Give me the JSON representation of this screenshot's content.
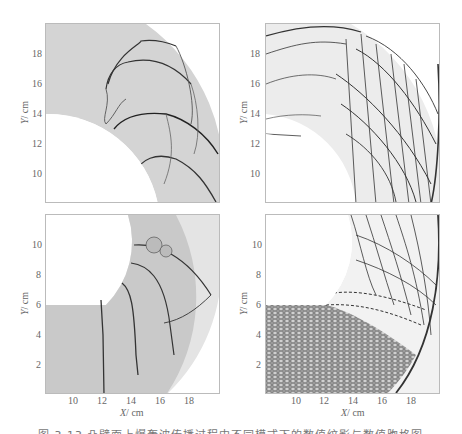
{
  "figure": {
    "caption_visible_fragment": "图 3.13  凸壁面上爆轰波传播过程中不同模式下的数值纹影与数值胞格图",
    "panels": [
      {
        "id": "top-left",
        "type": "numerical-schlieren",
        "yaxis": {
          "label": "Y",
          "unit": "cm",
          "ticks": [
            "18",
            "16",
            "14",
            "12",
            "10"
          ]
        },
        "xaxis": {
          "ticks": []
        }
      },
      {
        "id": "top-right",
        "type": "numerical-cellular",
        "yaxis": {
          "label": "Y",
          "unit": "cm",
          "ticks": [
            "18",
            "16",
            "14",
            "12",
            "10"
          ]
        },
        "xaxis": {
          "ticks": []
        }
      },
      {
        "id": "bottom-left",
        "type": "numerical-schlieren",
        "yaxis": {
          "label": "Y",
          "unit": "cm",
          "ticks": [
            "10",
            "8",
            "6",
            "4",
            "2"
          ]
        },
        "xaxis": {
          "label": "X",
          "unit": "cm",
          "ticks": [
            "10",
            "12",
            "14",
            "16",
            "18"
          ]
        }
      },
      {
        "id": "bottom-right",
        "type": "numerical-cellular",
        "yaxis": {
          "label": "Y",
          "unit": "cm",
          "ticks": [
            "10",
            "8",
            "6",
            "4",
            "2"
          ]
        },
        "xaxis": {
          "label": "X",
          "unit": "cm",
          "ticks": [
            "10",
            "12",
            "14",
            "16",
            "18"
          ]
        }
      }
    ],
    "colors": {
      "schlieren_bg": "#d4d4d4",
      "front_line": "#333333",
      "cell_lines": "#444444",
      "frame": "#bbbbbb"
    }
  },
  "labels": {
    "y": "Y",
    "x": "X",
    "unit": "/ cm"
  }
}
